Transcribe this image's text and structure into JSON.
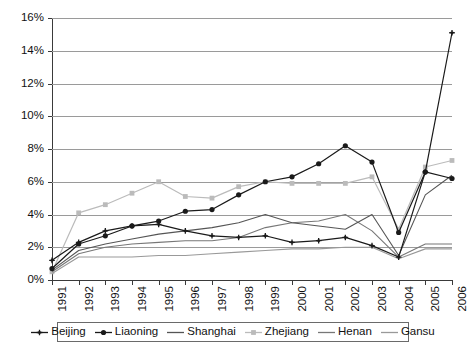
{
  "chart_data": {
    "type": "line",
    "title": "",
    "xlabel": "",
    "ylabel": "",
    "categories": [
      "1991",
      "1992",
      "1993",
      "1994",
      "1995",
      "1996",
      "1997",
      "1998",
      "1999",
      "2000",
      "2001",
      "2002",
      "2003",
      "2004",
      "2005",
      "2006"
    ],
    "ylim": [
      0,
      16
    ],
    "ytick_labels": [
      "0%",
      "2%",
      "4%",
      "6%",
      "8%",
      "10%",
      "12%",
      "14%",
      "16%"
    ],
    "ytick_values": [
      0,
      2,
      4,
      6,
      8,
      10,
      12,
      14,
      16
    ],
    "grid": true,
    "legend_position": "bottom",
    "value_suffix": "%",
    "series": [
      {
        "name": "Beijing",
        "color": "#1a1a1a",
        "marker": "plus",
        "values": [
          1.2,
          2.3,
          3.0,
          3.3,
          3.4,
          3.0,
          2.7,
          2.6,
          2.7,
          2.3,
          2.4,
          2.6,
          2.1,
          1.4,
          6.6,
          15.1
        ]
      },
      {
        "name": "Liaoning",
        "color": "#1a1a1a",
        "marker": "diamond",
        "values": [
          0.7,
          2.2,
          2.7,
          3.3,
          3.6,
          4.2,
          4.3,
          5.2,
          6.0,
          6.3,
          7.1,
          8.2,
          7.2,
          2.9,
          6.6,
          6.2
        ]
      },
      {
        "name": "Shanghai",
        "color": "#555555",
        "marker": "none",
        "values": [
          0.6,
          1.8,
          2.2,
          2.5,
          2.8,
          3.0,
          3.2,
          3.5,
          4.0,
          3.5,
          3.3,
          3.1,
          4.0,
          1.5,
          5.2,
          6.4
        ]
      },
      {
        "name": "Zhejiang",
        "color": "#bbbbbb",
        "marker": "square",
        "values": [
          0.5,
          4.1,
          4.6,
          5.3,
          6.0,
          5.1,
          5.0,
          5.7,
          6.0,
          5.9,
          5.9,
          5.9,
          6.3,
          3.1,
          6.9,
          7.3
        ]
      },
      {
        "name": "Henan",
        "color": "#777777",
        "marker": "none",
        "values": [
          0.5,
          1.6,
          2.0,
          2.2,
          2.3,
          2.4,
          2.4,
          2.6,
          3.2,
          3.5,
          3.6,
          4.0,
          3.0,
          1.4,
          2.2,
          2.2
        ]
      },
      {
        "name": "Gansu",
        "color": "#999999",
        "marker": "none",
        "values": [
          0.4,
          1.4,
          1.4,
          1.4,
          1.5,
          1.5,
          1.6,
          1.7,
          1.8,
          1.9,
          1.9,
          2.0,
          2.0,
          1.3,
          1.9,
          1.9
        ]
      }
    ]
  }
}
